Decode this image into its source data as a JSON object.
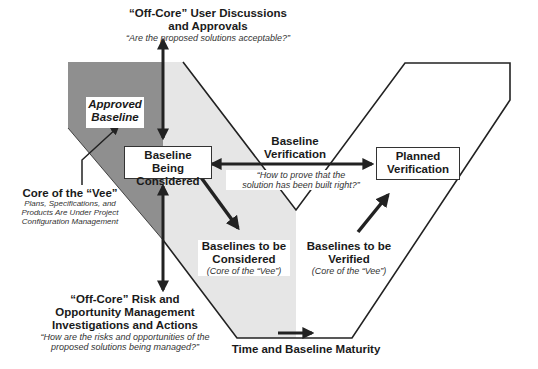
{
  "diagram": {
    "top_label": {
      "title_line1": "“Off-Core” User Discussions",
      "title_line2": "and Approvals",
      "question": "“Are the proposed solutions acceptable?”"
    },
    "approved_baseline": {
      "line1": "Approved",
      "line2": "Baseline"
    },
    "baseline_being_considered": {
      "line1": "Baseline Being",
      "line2": "Considered"
    },
    "core_of_vee": {
      "title": "Core of the “Vee”",
      "line1": "Plans, Specifications, and",
      "line2": "Products Are Under Project",
      "line3": "Configuration Management"
    },
    "baseline_verification": {
      "line1": "Baseline",
      "line2": "Verification",
      "question_line1": "“How to prove that the",
      "question_line2": "solution has been built right?”"
    },
    "planned_verification": {
      "line1": "Planned",
      "line2": "Verification"
    },
    "baselines_considered": {
      "line1": "Baselines to be",
      "line2": "Considered",
      "note": "(Core of the “Vee”)"
    },
    "baselines_verified": {
      "line1": "Baselines to be",
      "line2": "Verified",
      "note": "(Core of the “Vee”)"
    },
    "bottom_left_label": {
      "line1": "“Off-Core” Risk and",
      "line2": "Opportunity Management",
      "line3": "Investigations and Actions",
      "question_line1": "“How are the risks and opportunities of the",
      "question_line2": "proposed solutions being managed?”"
    },
    "time_axis": {
      "label": "Time and Baseline Maturity"
    },
    "colors": {
      "dark_region": "#8f8f8f",
      "light_region": "#e6e6e6",
      "outline": "#222222",
      "arrow": "#222222"
    }
  }
}
